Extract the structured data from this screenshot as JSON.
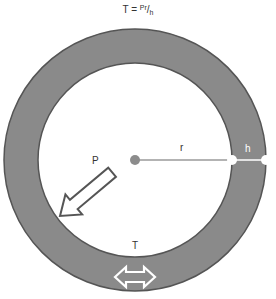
{
  "title": {
    "lhs": "T = ",
    "numerator": "Pr",
    "slash": "/",
    "denominator": "h"
  },
  "labels": {
    "pressure": "P",
    "radius": "r",
    "thickness": "h",
    "tension": "T"
  },
  "colors": {
    "wall_fill": "#8a8a8a",
    "wall_stroke": "#555555",
    "background": "#ffffff",
    "center_dot": "#8c8c8c",
    "radius_line": "#9a9a9a"
  },
  "geometry": {
    "center": [
      135,
      160
    ],
    "outer_radius": 131,
    "inner_radius": 97
  }
}
